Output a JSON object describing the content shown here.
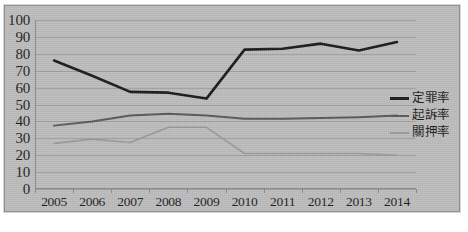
{
  "chart_data": {
    "type": "line",
    "title": "",
    "xlabel": "",
    "ylabel": "",
    "ylim": [
      0,
      100
    ],
    "ytick_step": 10,
    "grid": true,
    "legend_position": "right",
    "categories": [
      "2005",
      "2006",
      "2007",
      "2008",
      "2009",
      "2010",
      "2011",
      "2012",
      "2013",
      "2014"
    ],
    "yticks": [
      "100",
      "90",
      "80",
      "70",
      "60",
      "50",
      "40",
      "30",
      "20",
      "10",
      "0"
    ],
    "series": [
      {
        "name": "定罪率",
        "color": "#1a1a1a",
        "width": 2.6,
        "values": [
          76,
          67,
          57.5,
          57,
          53.5,
          82.5,
          83,
          86,
          82,
          87
        ]
      },
      {
        "name": "起訴率",
        "color": "#595959",
        "width": 2.0,
        "values": [
          37.5,
          40,
          43.5,
          44.5,
          43.5,
          41.5,
          41.5,
          42,
          42.5,
          43.5
        ]
      },
      {
        "name": "關押率",
        "color": "#9a9a9a",
        "width": 1.6,
        "values": [
          27,
          29.5,
          27.5,
          36.5,
          36.5,
          21,
          21,
          21,
          21,
          20
        ]
      }
    ]
  },
  "style": {
    "plot_background": "#bdbdbd",
    "gridline_color": "#9b9b9b",
    "axis_color": "#8a8a8a",
    "text_color": "#1d1d1d",
    "frame_border": "#8e8e8e"
  }
}
